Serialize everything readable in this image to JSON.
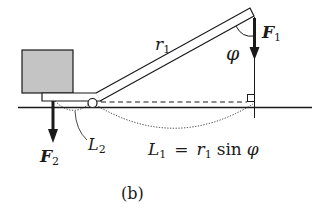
{
  "figure": {
    "caption": "(b)",
    "labels": {
      "r1_main": "r",
      "r1_sub": "1",
      "phi": "φ",
      "F1_main": "F",
      "F1_sub": "1",
      "F2_main": "F",
      "F2_sub": "2",
      "L2_main": "L",
      "L2_sub": "2",
      "L1_formula": {
        "lhs_main": "L",
        "lhs_sub": "1",
        "eq": "=",
        "r_main": "r",
        "r_sub": "1",
        "func": "sin",
        "var": "φ"
      }
    },
    "colors": {
      "stroke": "#1a1a1a",
      "box_fill": "#c4c4c4",
      "background": "#ffffff"
    }
  }
}
